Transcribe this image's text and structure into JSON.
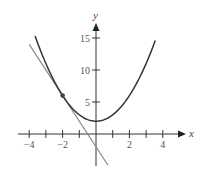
{
  "chart_data": {
    "type": "line",
    "title": "",
    "xlabel": "x",
    "ylabel": "y",
    "xlim": [
      -4.2,
      5
    ],
    "ylim": [
      -5,
      17
    ],
    "grid": false,
    "legend": null,
    "x_ticks": [
      -4,
      -3,
      -2,
      -1,
      1,
      2,
      3,
      4
    ],
    "x_tick_labels": [
      {
        "value": -4,
        "label": "−4"
      },
      {
        "value": -2,
        "label": "−2"
      },
      {
        "value": 2,
        "label": "2"
      },
      {
        "value": 4,
        "label": "4"
      }
    ],
    "y_ticks": [
      5,
      10,
      15
    ],
    "y_tick_labels": [
      {
        "value": 5,
        "label": "5"
      },
      {
        "value": 10,
        "label": "10"
      },
      {
        "value": 15,
        "label": "15"
      }
    ],
    "series": [
      {
        "name": "parabola",
        "description": "y = x^2 + 2",
        "x_range": [
          -3.65,
          3.55
        ],
        "color": "#333333",
        "x": [
          -3.65,
          -3,
          -2,
          -1,
          0,
          1,
          2,
          3,
          3.55
        ],
        "y": [
          15.32,
          11,
          6,
          3,
          2,
          3,
          6,
          11,
          14.6
        ]
      },
      {
        "name": "tangent-line",
        "description": "y = -4x - 2 (tangent at x = -2)",
        "x_range": [
          -4,
          0.72
        ],
        "color": "#888888",
        "x": [
          -4,
          0.72
        ],
        "y": [
          14,
          -4.88
        ]
      }
    ],
    "annotations": [
      {
        "type": "point",
        "x": -2,
        "y": 6,
        "label": "point of tangency"
      }
    ]
  }
}
